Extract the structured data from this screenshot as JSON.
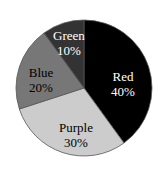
{
  "chart_data": {
    "type": "pie",
    "title": "",
    "categories": [
      "Red",
      "Purple",
      "Blue",
      "Green"
    ],
    "values": [
      40,
      30,
      20,
      10
    ],
    "labels": [
      "40%",
      "30%",
      "20%",
      "10%"
    ],
    "colors": [
      "#000000",
      "#cccccc",
      "#777777",
      "#333333"
    ],
    "label_colors": [
      "#ffffff",
      "#000000",
      "#000000",
      "#ffffff"
    ],
    "start_angle_deg": 0,
    "direction": "clockwise",
    "legend": "none"
  },
  "slices": [
    {
      "name": "Red",
      "pct": "40%"
    },
    {
      "name": "Purple",
      "pct": "30%"
    },
    {
      "name": "Blue",
      "pct": "20%"
    },
    {
      "name": "Green",
      "pct": "10%"
    }
  ]
}
